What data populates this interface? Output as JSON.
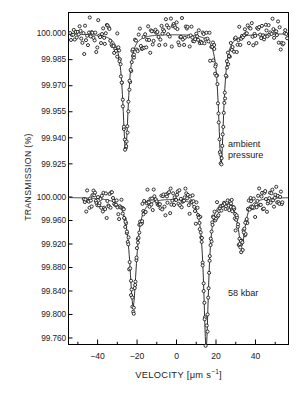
{
  "figure": {
    "axes": {
      "x": {
        "label_prefix": "VELOCITY [",
        "label_unit_base": "μm s",
        "label_unit_exp": "−1",
        "label_suffix": "]",
        "full_label": "VELOCITY [μm s−1]",
        "ticks": [
          "−40",
          "−20",
          "0",
          "20",
          "40"
        ],
        "tick_values": [
          -40,
          -20,
          0,
          20,
          40
        ],
        "range": [
          -55,
          57
        ],
        "minor_tick_step": 10
      },
      "y": {
        "label": "TRANSMISSION (%)",
        "top_ticks": [
          "100.000",
          "99.985",
          "99.970",
          "99.955",
          "99.940",
          "99.925"
        ],
        "top_tick_values": [
          100.0,
          99.985,
          99.97,
          99.955,
          99.94,
          99.925
        ],
        "bottom_ticks": [
          "100.000",
          "99.960",
          "99.920",
          "99.880",
          "99.840",
          "99.800",
          "99.760"
        ],
        "bottom_tick_values": [
          100.0,
          99.96,
          99.92,
          99.88,
          99.84,
          99.8,
          99.76
        ]
      }
    },
    "annotations": {
      "top_panel_line1": "ambient",
      "top_panel_line2": "pressure",
      "bottom_panel": "58 kbar"
    },
    "colors": {
      "axis": "#000000",
      "curve": "#1a1a1a",
      "marker_stroke": "#101010",
      "background": "#ffffff"
    }
  },
  "chart_data": {
    "type": "scatter",
    "title": "",
    "subtitle": "",
    "xlabel": "VELOCITY [μm s−1]",
    "ylabel": "TRANSMISSION (%)",
    "grid": false,
    "legend_position": "none",
    "xlim": [
      -55,
      57
    ],
    "xticks": [
      -40,
      -20,
      0,
      20,
      40
    ],
    "panels": [
      {
        "name": "ambient pressure",
        "label": "ambient pressure",
        "ylim": [
          99.918,
          100.009
        ],
        "yticks": [
          100.0,
          99.985,
          99.97,
          99.955,
          99.94,
          99.925
        ],
        "baseline": 100.0,
        "noise_amplitude": 0.009,
        "peaks": [
          {
            "center": -25.8,
            "depth": 0.067,
            "width": 1.7
          },
          {
            "center": 22.6,
            "depth": 0.075,
            "width": 1.6
          }
        ]
      },
      {
        "name": "58 kbar",
        "label": "58 kbar",
        "ylim": [
          99.748,
          100.012
        ],
        "yticks": [
          100.0,
          99.96,
          99.92,
          99.88,
          99.84,
          99.8,
          99.76
        ],
        "baseline": 100.0,
        "noise_amplitude": 0.022,
        "peaks": [
          {
            "center": -22.0,
            "depth": 0.185,
            "width": 2.1
          },
          {
            "center": 15.0,
            "depth": 0.255,
            "width": 1.5
          },
          {
            "center": 33.0,
            "depth": 0.082,
            "width": 2.2
          }
        ]
      }
    ]
  }
}
